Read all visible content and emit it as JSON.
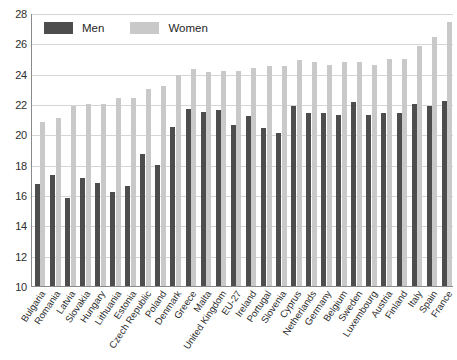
{
  "chart_data": {
    "type": "bar",
    "title": "",
    "xlabel": "",
    "ylabel": "",
    "ylim": [
      10,
      28
    ],
    "yticks": [
      10,
      12,
      14,
      16,
      18,
      20,
      22,
      24,
      26,
      28
    ],
    "grid": true,
    "legend_position": "top-left",
    "categories": [
      "Bulgaria",
      "Romania",
      "Latvia",
      "Slovakia",
      "Hungary",
      "Lithuania",
      "Estonia",
      "Czech Republic",
      "Poland",
      "Denmark",
      "Greece",
      "Malta",
      "United Kingdom",
      "EU-27",
      "Ireland",
      "Portugal",
      "Slovenia",
      "Cyprus",
      "Netherlands",
      "Germany",
      "Belgium",
      "Sweden",
      "Luxembourg",
      "Austria",
      "Finland",
      "Italy",
      "Spain",
      "France"
    ],
    "series": [
      {
        "name": "Men",
        "color": "#4d4d4d",
        "values": [
          16.7,
          17.3,
          15.8,
          17.1,
          16.8,
          16.2,
          16.6,
          18.7,
          18.0,
          20.5,
          21.7,
          21.5,
          21.6,
          20.6,
          21.2,
          20.4,
          20.1,
          21.9,
          21.4,
          21.4,
          21.3,
          22.1,
          21.3,
          21.4,
          21.4,
          22.0,
          21.9,
          22.2
        ]
      },
      {
        "name": "Women",
        "color": "#c9c9c9",
        "values": [
          20.8,
          21.1,
          21.9,
          22.0,
          22.0,
          22.4,
          22.4,
          23.0,
          23.2,
          23.9,
          24.3,
          24.1,
          24.2,
          24.2,
          24.4,
          24.5,
          24.5,
          24.9,
          24.8,
          24.6,
          24.8,
          24.8,
          24.6,
          25.0,
          25.0,
          25.8,
          26.4,
          27.4
        ]
      }
    ]
  },
  "legend": {
    "items": [
      {
        "label": "Men"
      },
      {
        "label": "Women"
      }
    ]
  }
}
